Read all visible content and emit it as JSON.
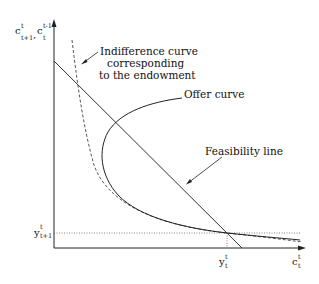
{
  "figure": {
    "y_axis_label": {
      "main": "c",
      "sup1": "t",
      "sub1": "t+1",
      "sep": ",",
      "main2": "c",
      "sup2": "t-1",
      "sub2": "t"
    },
    "x_axis_label": {
      "main": "c",
      "sup": "t",
      "sub": "t"
    },
    "y_tick_label": {
      "main": "y",
      "sup": "t",
      "sub": "t+1"
    },
    "x_tick_label": {
      "main": "y",
      "sup": "t",
      "sub": "t"
    },
    "annotations": {
      "indifference": [
        "Indifference curve",
        "corresponding",
        "to the endowment"
      ],
      "offer": "Offer curve",
      "feasibility": "Feasibility line"
    },
    "colors": {
      "line": "#222222",
      "dotted": "#666666",
      "background": "#ffffff"
    }
  }
}
